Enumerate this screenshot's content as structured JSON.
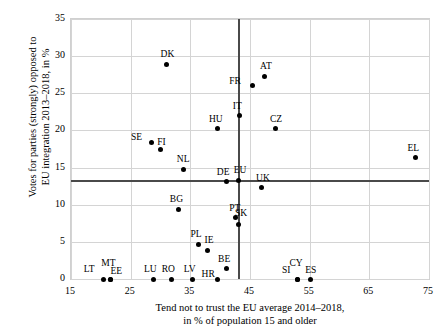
{
  "chart_data": {
    "type": "scatter",
    "title": "",
    "xlabel": "Tend not to trust the EU average 2014–2018,\nin % of population 15 and older",
    "xlabel_line1": "Tend not to trust the EU average 2014–2018,",
    "xlabel_line2": "in % of population 15 and older",
    "ylabel": "Votes for parties (strongly) opposed to\nEU integration 2013–2018, in %",
    "ylabel_line1": "Votes for parties (strongly) opposed to",
    "ylabel_line2": "EU integration 2013–2018, in %",
    "xlim": [
      15,
      75
    ],
    "ylim": [
      0,
      35
    ],
    "xticks": [
      15,
      25,
      35,
      45,
      55,
      65,
      75
    ],
    "yticks": [
      0,
      5,
      10,
      15,
      20,
      25,
      30,
      35
    ],
    "grid": true,
    "legend": "none",
    "marker_color": "#000000",
    "gridline_color": "#d4d4d4",
    "reference_line_color": "#4a4a4a",
    "reference_lines": {
      "horizontal_y": 13.3,
      "vertical_x": 43.0
    },
    "points": [
      {
        "label": "DK",
        "x": 31.0,
        "y": 28.9,
        "lx": 1,
        "ly": 14
      },
      {
        "label": "AT",
        "x": 47.5,
        "y": 27.3,
        "lx": 1,
        "ly": 14
      },
      {
        "label": "FR",
        "x": 45.5,
        "y": 26.1,
        "lx": -18,
        "ly": 8
      },
      {
        "label": "IT",
        "x": 43.2,
        "y": 22.0,
        "lx": -2,
        "ly": 14
      },
      {
        "label": "CZ",
        "x": 49.2,
        "y": 20.2,
        "lx": 1,
        "ly": 14
      },
      {
        "label": "HU",
        "x": 39.6,
        "y": 20.2,
        "lx": -2,
        "ly": 14
      },
      {
        "label": "SE",
        "x": 28.5,
        "y": 18.4,
        "lx": -15,
        "ly": 9
      },
      {
        "label": "FI",
        "x": 30.0,
        "y": 17.5,
        "lx": 1,
        "ly": 11
      },
      {
        "label": "EL",
        "x": 72.7,
        "y": 16.3,
        "lx": -2,
        "ly": 14
      },
      {
        "label": "NL",
        "x": 33.8,
        "y": 14.8,
        "lx": 0,
        "ly": 14
      },
      {
        "label": "DE",
        "x": 41.0,
        "y": 13.1,
        "lx": -3,
        "ly": 14
      },
      {
        "label": "EU",
        "x": 43.0,
        "y": 13.3,
        "lx": 2,
        "ly": 14
      },
      {
        "label": "UK",
        "x": 47.0,
        "y": 12.3,
        "lx": 1,
        "ly": 14
      },
      {
        "label": "BG",
        "x": 33.0,
        "y": 9.4,
        "lx": -2,
        "ly": 14
      },
      {
        "label": "PT",
        "x": 42.6,
        "y": 8.3,
        "lx": -1,
        "ly": 13
      },
      {
        "label": "SK",
        "x": 43.0,
        "y": 7.4,
        "lx": 3,
        "ly": 15
      },
      {
        "label": "PL",
        "x": 36.3,
        "y": 4.7,
        "lx": -2,
        "ly": 14
      },
      {
        "label": "IE",
        "x": 37.8,
        "y": 3.9,
        "lx": 2,
        "ly": 14
      },
      {
        "label": "BE",
        "x": 41.0,
        "y": 1.4,
        "lx": -2,
        "ly": 14
      },
      {
        "label": "LT",
        "x": 20.4,
        "y": 0.0,
        "lx": -14,
        "ly": 14
      },
      {
        "label": "MT",
        "x": 21.6,
        "y": 0.0,
        "lx": -2,
        "ly": 20
      },
      {
        "label": "EE",
        "x": 21.6,
        "y": 0.0,
        "lx": 6,
        "ly": 12
      },
      {
        "label": "LU",
        "x": 28.8,
        "y": 0.0,
        "lx": -3,
        "ly": 14
      },
      {
        "label": "RO",
        "x": 31.8,
        "y": 0.0,
        "lx": -3,
        "ly": 14
      },
      {
        "label": "LV",
        "x": 35.4,
        "y": 0.0,
        "lx": -3,
        "ly": 14
      },
      {
        "label": "HR",
        "x": 39.5,
        "y": 0.0,
        "lx": -9,
        "ly": 9
      },
      {
        "label": "SI",
        "x": 52.9,
        "y": 0.0,
        "lx": -11,
        "ly": 13
      },
      {
        "label": "CY",
        "x": 52.9,
        "y": 0.0,
        "lx": -1,
        "ly": 20
      },
      {
        "label": "ES",
        "x": 55.2,
        "y": 0.0,
        "lx": 0,
        "ly": 13
      }
    ]
  }
}
